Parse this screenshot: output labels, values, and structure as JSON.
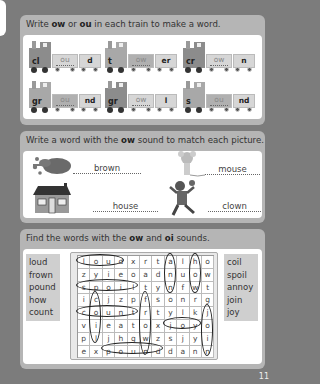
{
  "section1": {
    "instruction_pre": "Write ",
    "instruction_b1": "ow",
    "instruction_mid": " or ",
    "instruction_b2": "ou",
    "instruction_post": " in each train to make a word.",
    "trains": [
      {
        "start": "cl",
        "answer": "ou",
        "end": "d"
      },
      {
        "start": "t",
        "answer": "ow",
        "end": "er"
      },
      {
        "start": "cr",
        "answer": "ow",
        "end": "n"
      },
      {
        "start": "gr",
        "answer": "ou",
        "end": "nd"
      },
      {
        "start": "gr",
        "answer": "ow",
        "end": "l"
      },
      {
        "start": "s",
        "answer": "ou",
        "end": "nd"
      }
    ]
  },
  "section2": {
    "instruction_pre": "Write a word with the ",
    "instruction_b": "ow",
    "instruction_post": " sound to match each picture.",
    "items": [
      {
        "picture": "paint-splat",
        "answer": "brown"
      },
      {
        "picture": "mouse",
        "answer": "mouse"
      },
      {
        "picture": "house",
        "answer": "house"
      },
      {
        "picture": "clown",
        "answer": "clown"
      }
    ]
  },
  "section3": {
    "instruction_pre": "Find the words with the ",
    "instruction_b1": "ow",
    "instruction_mid": " and ",
    "instruction_b2": "oi",
    "instruction_post": " sounds.",
    "left_words": [
      "loud",
      "frown",
      "pound",
      "how",
      "count"
    ],
    "right_words": [
      "coil",
      "spoil",
      "annoy",
      "join",
      "joy"
    ],
    "grid": [
      [
        "l",
        "o",
        "u",
        "d",
        "x",
        "r",
        "t",
        "a",
        "l",
        "h",
        "o"
      ],
      [
        "z",
        "y",
        "i",
        "e",
        "o",
        "a",
        "d",
        "n",
        "u",
        "o",
        "w"
      ],
      [
        "s",
        "p",
        "o",
        "i",
        "l",
        "t",
        "y",
        "n",
        "f",
        "w",
        "t"
      ],
      [
        "i",
        "c",
        "j",
        "z",
        "p",
        "f",
        "s",
        "o",
        "n",
        "r",
        "g"
      ],
      [
        "c",
        "o",
        "u",
        "n",
        "t",
        "r",
        "t",
        "y",
        "l",
        "k",
        "j"
      ],
      [
        "v",
        "i",
        "e",
        "a",
        "t",
        "o",
        "x",
        "j",
        "o",
        "y",
        "o"
      ],
      [
        "p",
        "l",
        "j",
        "h",
        "g",
        "w",
        "z",
        "s",
        "j",
        "y",
        "i"
      ],
      [
        "e",
        "x",
        "p",
        "o",
        "u",
        "n",
        "d",
        "d",
        "a",
        "n",
        "n"
      ]
    ]
  },
  "page_number": "11"
}
